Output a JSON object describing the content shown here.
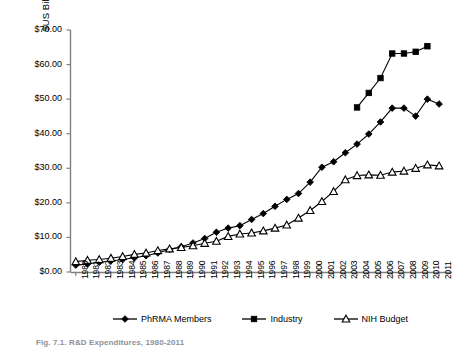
{
  "figure": {
    "caption": "Fig. 7.1. R&D Expenditures, 1980-2011",
    "y_axis_title": "$US Billions"
  },
  "legend": {
    "position": "bottom",
    "items": [
      {
        "label": "PhRMA Members",
        "marker": "filled-diamond-icon",
        "color": "#000000"
      },
      {
        "label": "Industry",
        "marker": "filled-square-icon",
        "color": "#000000"
      },
      {
        "label": "NIH Budget",
        "marker": "open-triangle-icon",
        "color": "#000000"
      }
    ]
  },
  "chart_data": {
    "type": "line",
    "title": "",
    "subtitle": "",
    "xlabel": "",
    "ylabel": "$US Billions",
    "ylim": [
      0,
      70
    ],
    "ytick_step": 10,
    "ytick_labels": [
      "$0.00",
      "$10.00",
      "$20.00",
      "$30.00",
      "$40.00",
      "$50.00",
      "$60.00",
      "$70.00"
    ],
    "ytick_values": [
      0,
      10,
      20,
      30,
      40,
      50,
      60,
      70
    ],
    "grid": false,
    "legend_position": "bottom",
    "x": [
      1980,
      1981,
      1982,
      1983,
      1984,
      1985,
      1986,
      1987,
      1988,
      1989,
      1990,
      1991,
      1992,
      1993,
      1994,
      1995,
      1996,
      1997,
      1998,
      1999,
      2000,
      2001,
      2002,
      2003,
      2004,
      2005,
      2006,
      2007,
      2008,
      2009,
      2010,
      2011
    ],
    "xtick_labels": [
      "1980",
      "1981",
      "1982",
      "1983",
      "1984",
      "1985",
      "1986",
      "1987",
      "1988",
      "1989",
      "1990",
      "1991",
      "1992",
      "1993",
      "1994",
      "1995",
      "1996",
      "1997",
      "1998",
      "1999",
      "2000",
      "2001",
      "2002",
      "2003",
      "2004",
      "2005",
      "2006",
      "2007",
      "2008",
      "2009",
      "2010",
      "2011"
    ],
    "series": [
      {
        "name": "PhRMA Members",
        "marker": "filled-diamond",
        "values": [
          2.0,
          2.3,
          2.8,
          3.2,
          3.6,
          4.1,
          4.7,
          5.5,
          6.5,
          7.3,
          8.4,
          9.7,
          11.5,
          12.7,
          13.4,
          15.2,
          16.9,
          19.0,
          21.0,
          22.7,
          26.0,
          30.3,
          31.9,
          34.5,
          37.0,
          39.9,
          43.4,
          47.4,
          47.4,
          45.1,
          50.0,
          48.6
        ]
      },
      {
        "name": "Industry",
        "marker": "filled-square",
        "values": [
          null,
          null,
          null,
          null,
          null,
          null,
          null,
          null,
          null,
          null,
          null,
          null,
          null,
          null,
          null,
          null,
          null,
          null,
          null,
          null,
          null,
          null,
          null,
          null,
          47.6,
          51.8,
          56.1,
          63.2,
          63.2,
          63.7,
          65.3,
          null
        ]
      },
      {
        "name": "NIH Budget",
        "marker": "open-triangle",
        "values": [
          3.0,
          3.4,
          3.6,
          4.0,
          4.5,
          5.1,
          5.5,
          6.2,
          6.7,
          7.1,
          7.6,
          8.3,
          8.9,
          10.3,
          11.0,
          11.3,
          11.9,
          12.7,
          13.6,
          15.6,
          17.8,
          20.4,
          23.3,
          26.7,
          27.9,
          28.1,
          28.0,
          28.9,
          29.2,
          30.0,
          31.0,
          30.7
        ]
      }
    ]
  }
}
